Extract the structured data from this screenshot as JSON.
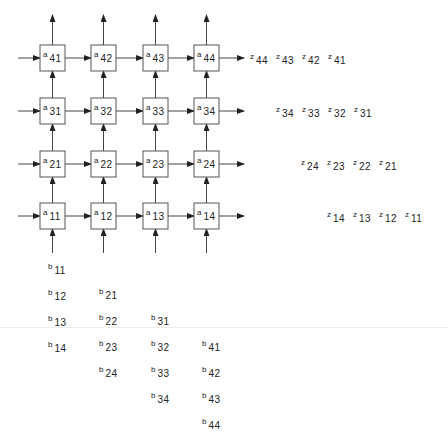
{
  "diagram": {
    "cells": [
      {
        "row": 4,
        "col": 1,
        "label": "a",
        "sub": "41"
      },
      {
        "row": 4,
        "col": 2,
        "label": "a",
        "sub": "42"
      },
      {
        "row": 4,
        "col": 3,
        "label": "a",
        "sub": "43"
      },
      {
        "row": 4,
        "col": 4,
        "label": "a",
        "sub": "44"
      },
      {
        "row": 3,
        "col": 1,
        "label": "a",
        "sub": "31"
      },
      {
        "row": 3,
        "col": 2,
        "label": "a",
        "sub": "32"
      },
      {
        "row": 3,
        "col": 3,
        "label": "a",
        "sub": "33"
      },
      {
        "row": 3,
        "col": 4,
        "label": "a",
        "sub": "34"
      },
      {
        "row": 2,
        "col": 1,
        "label": "a",
        "sub": "21"
      },
      {
        "row": 2,
        "col": 2,
        "label": "a",
        "sub": "22"
      },
      {
        "row": 2,
        "col": 3,
        "label": "a",
        "sub": "23"
      },
      {
        "row": 2,
        "col": 4,
        "label": "a",
        "sub": "24"
      },
      {
        "row": 1,
        "col": 1,
        "label": "a",
        "sub": "11"
      },
      {
        "row": 1,
        "col": 2,
        "label": "a",
        "sub": "12"
      },
      {
        "row": 1,
        "col": 3,
        "label": "a",
        "sub": "13"
      },
      {
        "row": 1,
        "col": 4,
        "label": "a",
        "sub": "14"
      }
    ],
    "outputs": [
      {
        "row": 4,
        "items": [
          {
            "b": "z",
            "s": "44"
          },
          {
            "b": "z",
            "s": "43"
          },
          {
            "b": "z",
            "s": "42"
          },
          {
            "b": "z",
            "s": "41"
          }
        ]
      },
      {
        "row": 3,
        "items": [
          {
            "b": "z",
            "s": "34"
          },
          {
            "b": "z",
            "s": "33"
          },
          {
            "b": "z",
            "s": "32"
          },
          {
            "b": "z",
            "s": "31"
          }
        ]
      },
      {
        "row": 2,
        "items": [
          {
            "b": "z",
            "s": "24"
          },
          {
            "b": "z",
            "s": "23"
          },
          {
            "b": "z",
            "s": "22"
          },
          {
            "b": "z",
            "s": "21"
          }
        ]
      },
      {
        "row": 1,
        "items": [
          {
            "b": "z",
            "s": "14"
          },
          {
            "b": "z",
            "s": "13"
          },
          {
            "b": "z",
            "s": "12"
          },
          {
            "b": "z",
            "s": "11"
          }
        ]
      }
    ],
    "inputs": [
      {
        "col": 1,
        "items": [
          {
            "b": "b",
            "s": "11"
          },
          {
            "b": "b",
            "s": "12"
          },
          {
            "b": "b",
            "s": "13"
          },
          {
            "b": "b",
            "s": "14"
          }
        ]
      },
      {
        "col": 2,
        "items": [
          {
            "b": "b",
            "s": "21"
          },
          {
            "b": "b",
            "s": "22"
          },
          {
            "b": "b",
            "s": "23"
          },
          {
            "b": "b",
            "s": "24"
          }
        ]
      },
      {
        "col": 3,
        "items": [
          {
            "b": "b",
            "s": "31"
          },
          {
            "b": "b",
            "s": "32"
          },
          {
            "b": "b",
            "s": "33"
          },
          {
            "b": "b",
            "s": "34"
          }
        ]
      },
      {
        "col": 4,
        "items": [
          {
            "b": "b",
            "s": "41"
          },
          {
            "b": "b",
            "s": "42"
          },
          {
            "b": "b",
            "s": "43"
          },
          {
            "b": "b",
            "s": "44"
          }
        ]
      }
    ],
    "colors": {
      "stroke": "#333333",
      "box_fill": "#ffffff",
      "text": "#222222"
    }
  }
}
